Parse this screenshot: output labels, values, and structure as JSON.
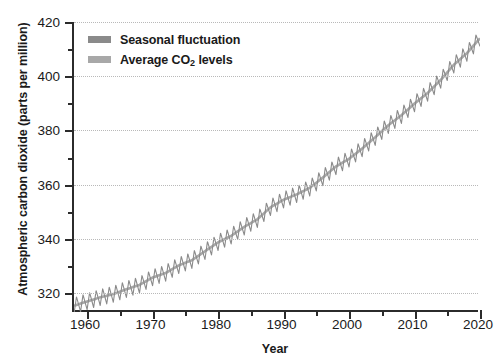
{
  "chart_data": {
    "type": "line",
    "title": "",
    "xlabel": "Year",
    "ylabel": "Atmospheric carbon dioxide (parts per million)",
    "xlim": [
      1958,
      2020
    ],
    "ylim": [
      313,
      420
    ],
    "grid": true,
    "legend_position": "top-left",
    "x_ticks": [
      1960,
      1970,
      1980,
      1990,
      2000,
      2010,
      2020
    ],
    "x_tick_labels": [
      "1960",
      "1970",
      "1980",
      "1990",
      "2000",
      "2010",
      "2020"
    ],
    "x_minor_ticks": [
      1965,
      1975,
      1985,
      1995,
      2005,
      2015
    ],
    "y_ticks": [
      320,
      340,
      360,
      380,
      400,
      420
    ],
    "y_tick_labels": [
      "320",
      "340",
      "360",
      "380",
      "400",
      "420"
    ],
    "y_minor_ticks": [
      330,
      350,
      370,
      390,
      410
    ],
    "seasonal_amplitude_ppm": 6,
    "series": [
      {
        "name": "Seasonal fluctuation",
        "color": "#8a8a8a",
        "style": "sawtooth-oscillation"
      },
      {
        "name": "Average CO2 levels",
        "color": "#a8a8a8",
        "style": "smooth-trend",
        "x": [
          1958,
          1960,
          1962,
          1964,
          1966,
          1968,
          1970,
          1972,
          1974,
          1976,
          1978,
          1980,
          1982,
          1984,
          1986,
          1988,
          1990,
          1992,
          1994,
          1996,
          1998,
          2000,
          2002,
          2004,
          2006,
          2008,
          2010,
          2012,
          2014,
          2016,
          2018,
          2020
        ],
        "values": [
          315.3,
          316.9,
          318.4,
          319.6,
          321.4,
          323.0,
          325.7,
          327.4,
          330.2,
          332.1,
          335.4,
          338.7,
          341.1,
          344.4,
          347.2,
          351.6,
          354.4,
          356.4,
          358.8,
          362.6,
          366.7,
          369.5,
          373.3,
          377.5,
          381.9,
          385.6,
          389.9,
          393.8,
          398.6,
          404.2,
          408.5,
          414.0
        ]
      }
    ]
  },
  "legend": {
    "items": [
      {
        "label_prefix": "Seasonal fluctuation",
        "label_suffix": "",
        "subscript": ""
      },
      {
        "label_prefix": "Average CO",
        "subscript": "2",
        "label_suffix": " levels"
      }
    ]
  },
  "axes": {
    "y_title": "Atmospheric carbon dioxide (parts per million)",
    "x_title": "Year"
  }
}
